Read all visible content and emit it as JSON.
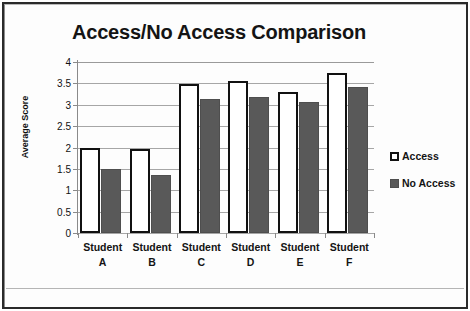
{
  "chart_data": {
    "type": "bar",
    "title": "Access/No Access Comparison",
    "xlabel": "",
    "ylabel": "Average Score",
    "ylim": [
      0,
      4
    ],
    "ytick_step": 0.5,
    "ytick_labels": [
      "4",
      "3.5",
      "3",
      "2.5",
      "2",
      "1.5",
      "1",
      "0.5",
      "0"
    ],
    "grid": true,
    "legend_position": "right",
    "categories": [
      "Student A",
      "Student B",
      "Student C",
      "Student D",
      "Student E",
      "Student F"
    ],
    "category_lines": [
      [
        "Student",
        "A"
      ],
      [
        "Student",
        "B"
      ],
      [
        "Student",
        "C"
      ],
      [
        "Student",
        "D"
      ],
      [
        "Student",
        "E"
      ],
      [
        "Student",
        "F"
      ]
    ],
    "series": [
      {
        "name": "Access",
        "color": "#ffffff",
        "border_color": "#111111",
        "values": [
          2.0,
          1.97,
          3.48,
          3.55,
          3.3,
          3.75
        ]
      },
      {
        "name": "No Access",
        "color": "#595959",
        "border_color": "#4e4e4e",
        "values": [
          1.5,
          1.35,
          3.13,
          3.18,
          3.07,
          3.42
        ]
      }
    ]
  },
  "legend": {
    "items": [
      {
        "label": "Access"
      },
      {
        "label": "No Access"
      }
    ]
  }
}
